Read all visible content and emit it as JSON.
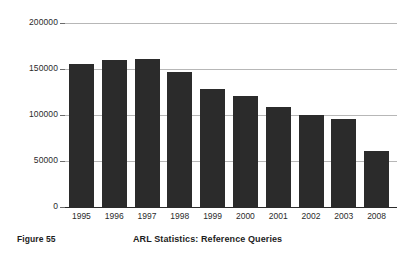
{
  "figure": {
    "number_label": "Figure 55",
    "title": "ARL Statistics: Reference Queries"
  },
  "colors": {
    "bar": "#2b2b2b",
    "gridline": "#b7b7b7",
    "axis": "#2b2b2b",
    "background": "#ffffff",
    "text": "#1d1d1d"
  },
  "chart_data": {
    "type": "bar",
    "title": "ARL Statistics: Reference Queries",
    "xlabel": "",
    "ylabel": "",
    "categories": [
      "1995",
      "1996",
      "1997",
      "1998",
      "1999",
      "2000",
      "2001",
      "2002",
      "2003",
      "2008"
    ],
    "values": [
      155500,
      160000,
      161500,
      147000,
      128500,
      121000,
      109000,
      100500,
      95500,
      60500
    ],
    "ylim": [
      0,
      200000
    ],
    "ytick_labels": [
      "200000",
      "150000",
      "100000",
      "50000",
      "0"
    ],
    "ytick_values": [
      200000,
      150000,
      100000,
      50000,
      0
    ],
    "grid": true,
    "legend": null,
    "legend_position": "none"
  }
}
